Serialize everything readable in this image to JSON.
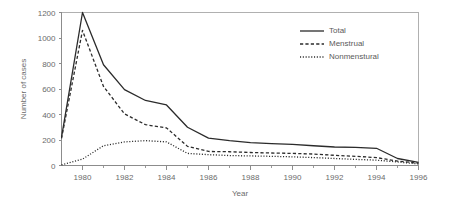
{
  "chart_data": {
    "type": "line",
    "title": "",
    "xlabel": "Year",
    "ylabel": "Number of cases",
    "xlim": [
      1979,
      1996
    ],
    "ylim": [
      0,
      1200
    ],
    "grid": false,
    "legend_position": "upper-right",
    "x": [
      1979,
      1980,
      1981,
      1982,
      1983,
      1984,
      1985,
      1986,
      1987,
      1988,
      1989,
      1990,
      1991,
      1992,
      1993,
      1994,
      1995,
      1996
    ],
    "xticks_major": [
      1980,
      1982,
      1984,
      1986,
      1988,
      1990,
      1992,
      1994,
      1996
    ],
    "xticks_major_labels": [
      "1980",
      "1982",
      "1984",
      "1986",
      "1988",
      "1990",
      "1992",
      "1994",
      "1996"
    ],
    "yticks": [
      0,
      200,
      400,
      600,
      800,
      1000,
      1200
    ],
    "ytick_labels": [
      "0",
      "200",
      "400",
      "600",
      "800",
      "1000",
      "1200"
    ],
    "series": [
      {
        "name": "Total",
        "style": "solid",
        "values": [
          220,
          1200,
          790,
          595,
          510,
          475,
          300,
          215,
          195,
          180,
          172,
          165,
          155,
          145,
          142,
          135,
          55,
          25
        ]
      },
      {
        "name": "Menstrual",
        "style": "dashed",
        "values": [
          212,
          1060,
          620,
          405,
          320,
          295,
          150,
          110,
          108,
          102,
          98,
          95,
          90,
          80,
          72,
          62,
          35,
          18
        ]
      },
      {
        "name": "Nonmenstural",
        "style": "dotted",
        "values": [
          5,
          50,
          155,
          185,
          195,
          185,
          95,
          85,
          78,
          75,
          72,
          68,
          62,
          55,
          48,
          42,
          28,
          12
        ]
      }
    ]
  },
  "legend": {
    "items": [
      {
        "label": "Total",
        "style": "solid"
      },
      {
        "label": "Menstrual",
        "style": "dashed"
      },
      {
        "label": "Nonmenstural",
        "style": "dotted"
      }
    ]
  },
  "axes": {
    "x_title": "Year",
    "y_title": "Number of cases"
  }
}
